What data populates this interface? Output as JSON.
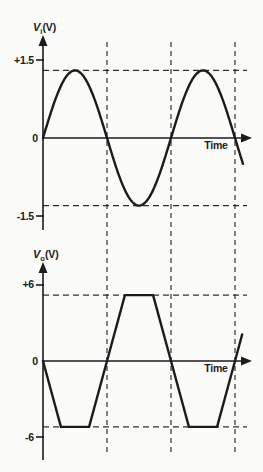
{
  "figure": {
    "description_visible": false,
    "colors": {
      "background": "#fbfbf9",
      "ink": "#1b1b1b"
    }
  },
  "chart_data": [
    {
      "type": "line",
      "title": "Input waveform",
      "ylabel": "Vi (V)",
      "ylabel_symbol": "V",
      "ylabel_subscript": "i",
      "ylabel_unit": "(V)",
      "xlabel": "Time",
      "waveform": "sine",
      "amplitude_V": 1.3,
      "cycles_shown": 1.5625,
      "ytick_labels": [
        "+1.5",
        "0",
        "-1.5"
      ],
      "ytick_values": [
        1.5,
        0,
        -1.5
      ],
      "dashed_levels_V": [
        1.3,
        -1.3
      ],
      "zero_crossings_t": [
        0,
        0.5,
        1.0,
        1.5
      ],
      "ylim": [
        -1.9,
        2.0
      ],
      "grid": "shared dashed vertical gridlines at t = 0.5, 1.0, 1.5"
    },
    {
      "type": "line",
      "title": "Output waveform (clipped, inverted)",
      "ylabel": "Vo (V)",
      "ylabel_symbol": "V",
      "ylabel_subscript": "o",
      "ylabel_unit": "(V)",
      "xlabel": "Time",
      "waveform": "trapezoid",
      "clip_level_V": 5.2,
      "ytick_labels": [
        "+6",
        "0",
        "-6"
      ],
      "ytick_values": [
        6,
        0,
        -6
      ],
      "dashed_levels_V": [
        5.2,
        -5.2
      ],
      "zero_crossings_t": [
        0,
        0.5,
        1.0,
        1.5
      ],
      "points_tv": [
        [
          0,
          0
        ],
        [
          0.14,
          -5.2
        ],
        [
          0.36,
          -5.2
        ],
        [
          0.5,
          0
        ],
        [
          0.64,
          5.2
        ],
        [
          0.86,
          5.2
        ],
        [
          1.0,
          0
        ],
        [
          1.14,
          -5.2
        ],
        [
          1.36,
          -5.2
        ],
        [
          1.5,
          0
        ],
        [
          1.556,
          2.1
        ]
      ],
      "ylim": [
        -7.8,
        7.7
      ]
    }
  ]
}
